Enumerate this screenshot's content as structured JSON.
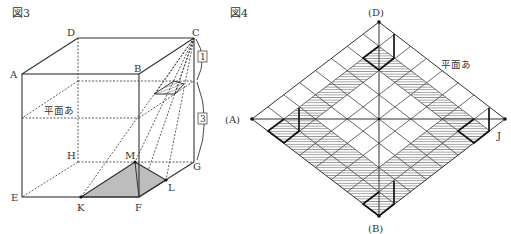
{
  "fig3": {
    "title": "図3",
    "vertices": {
      "A": "A",
      "B": "B",
      "C": "C",
      "D": "D",
      "E": "E",
      "F": "F",
      "G": "G",
      "H": "H",
      "K": "K",
      "L": "L",
      "M": "M"
    },
    "plane_label": "平面あ",
    "ratio_top": "1",
    "ratio_bottom": "3"
  },
  "fig4": {
    "title": "図4",
    "labels": {
      "A": "(A)",
      "B": "(B)",
      "D": "(D)",
      "J": "J"
    },
    "plane_label": "平面あ",
    "grid_divisions": 8
  },
  "colors": {
    "line": "#333333",
    "shade": "#bdbdbd",
    "hatch": "#555555"
  }
}
